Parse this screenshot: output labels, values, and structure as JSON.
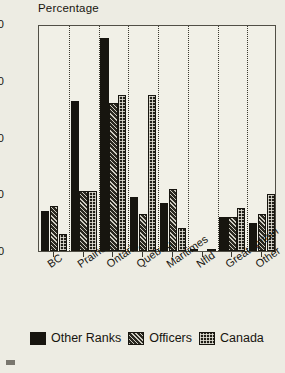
{
  "chart_data": {
    "type": "bar",
    "title": "Percentage",
    "xlabel": "",
    "ylabel": "Percentage",
    "ylim": [
      0,
      40
    ],
    "yticks": [
      0,
      10,
      20,
      30,
      40
    ],
    "grid": "vertical-dotted-between-groups",
    "legend_position": "bottom",
    "categories": [
      "BC",
      "Prairies",
      "Ontario",
      "Quebec",
      "Maritimes",
      "Nfld",
      "Great Britain",
      "Other"
    ],
    "series": [
      {
        "name": "Other Ranks",
        "pattern": "solid",
        "values": [
          7.0,
          26.5,
          37.5,
          9.5,
          8.5,
          0.3,
          6.0,
          5.0
        ]
      },
      {
        "name": "Officers",
        "pattern": "hatched",
        "values": [
          8.0,
          10.5,
          26.0,
          6.5,
          11.0,
          0.0,
          6.0,
          6.5
        ]
      },
      {
        "name": "Canada",
        "pattern": "grid",
        "values": [
          3.0,
          10.5,
          27.5,
          27.5,
          4.0,
          0.3,
          7.5,
          10.0
        ]
      }
    ]
  },
  "legend": {
    "items": [
      {
        "label": "Other Ranks",
        "style": "sw-ranks"
      },
      {
        "label": "Officers",
        "style": "sw-officers"
      },
      {
        "label": "Canada",
        "style": "sw-canada"
      }
    ]
  }
}
